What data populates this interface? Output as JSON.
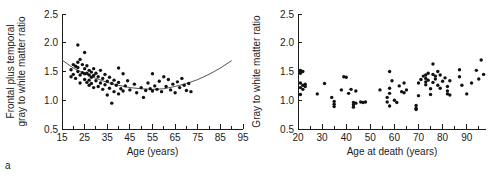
{
  "figure": {
    "panel_a_label": "a",
    "panel_b_label": "b"
  },
  "chart_data": [
    {
      "id": "panel-a",
      "type": "scatter",
      "title": "",
      "xlabel": "Age (years)",
      "ylabel": "Frontal plus temporal gray to white matter ratio",
      "ylabel_line1": "Frontal plus temporal",
      "ylabel_line2": "gray to white matter ratio",
      "xlim": [
        15,
        95
      ],
      "ylim": [
        0.5,
        2.5
      ],
      "xticks": [
        15,
        25,
        35,
        45,
        55,
        65,
        75,
        85,
        95
      ],
      "xtick_labels": [
        "15",
        "25",
        "35",
        "45",
        "55",
        "65",
        "75",
        "85",
        "95"
      ],
      "xminor_step": 5,
      "yticks": [
        0.5,
        1.0,
        1.5,
        2.0,
        2.5
      ],
      "ytick_labels": [
        "0.5",
        "1.0",
        "1.5",
        "2.0",
        "2.5"
      ],
      "grid": false,
      "legend": "none",
      "fit": {
        "type": "quadratic-curve",
        "description": "U-shaped fitted regression curve, minimum near age 50",
        "points": [
          [
            15,
            1.7
          ],
          [
            20,
            1.56
          ],
          [
            25,
            1.46
          ],
          [
            30,
            1.38
          ],
          [
            35,
            1.31
          ],
          [
            40,
            1.26
          ],
          [
            45,
            1.22
          ],
          [
            50,
            1.2
          ],
          [
            55,
            1.19
          ],
          [
            60,
            1.2
          ],
          [
            65,
            1.24
          ],
          [
            70,
            1.29
          ],
          [
            75,
            1.36
          ],
          [
            80,
            1.45
          ],
          [
            85,
            1.56
          ],
          [
            90,
            1.69
          ]
        ]
      },
      "points": [
        [
          19,
          1.53
        ],
        [
          19,
          1.41
        ],
        [
          20,
          1.62
        ],
        [
          20,
          1.45
        ],
        [
          21,
          1.59
        ],
        [
          21,
          1.38
        ],
        [
          22,
          1.96
        ],
        [
          22,
          1.66
        ],
        [
          22,
          1.57
        ],
        [
          22,
          1.5
        ],
        [
          23,
          1.71
        ],
        [
          23,
          1.44
        ],
        [
          23,
          1.3
        ],
        [
          24,
          1.62
        ],
        [
          24,
          1.48
        ],
        [
          25,
          1.83
        ],
        [
          25,
          1.55
        ],
        [
          25,
          1.46
        ],
        [
          25,
          1.36
        ],
        [
          26,
          1.6
        ],
        [
          26,
          1.47
        ],
        [
          26,
          1.31
        ],
        [
          27,
          1.52
        ],
        [
          27,
          1.44
        ],
        [
          27,
          1.35
        ],
        [
          27,
          1.26
        ],
        [
          28,
          1.49
        ],
        [
          28,
          1.4
        ],
        [
          28,
          1.29
        ],
        [
          29,
          1.55
        ],
        [
          29,
          1.43
        ],
        [
          29,
          1.22
        ],
        [
          30,
          1.47
        ],
        [
          30,
          1.34
        ],
        [
          31,
          1.41
        ],
        [
          31,
          1.24
        ],
        [
          32,
          1.52
        ],
        [
          32,
          1.3
        ],
        [
          33,
          1.38
        ],
        [
          33,
          1.19
        ],
        [
          34,
          1.45
        ],
        [
          34,
          1.27
        ],
        [
          35,
          1.33
        ],
        [
          35,
          1.09
        ],
        [
          36,
          1.4
        ],
        [
          36,
          1.21
        ],
        [
          37,
          1.29
        ],
        [
          37,
          0.95
        ],
        [
          38,
          1.35
        ],
        [
          38,
          1.15
        ],
        [
          39,
          1.26
        ],
        [
          40,
          1.56
        ],
        [
          40,
          1.31
        ],
        [
          40,
          1.11
        ],
        [
          41,
          1.2
        ],
        [
          42,
          1.46
        ],
        [
          42,
          1.16
        ],
        [
          43,
          1.25
        ],
        [
          44,
          1.34
        ],
        [
          45,
          1.18
        ],
        [
          47,
          1.28
        ],
        [
          48,
          1.13
        ],
        [
          50,
          1.22
        ],
        [
          51,
          1.05
        ],
        [
          52,
          1.17
        ],
        [
          53,
          1.3
        ],
        [
          54,
          1.2
        ],
        [
          55,
          1.46
        ],
        [
          55,
          1.16
        ],
        [
          56,
          1.25
        ],
        [
          57,
          1.19
        ],
        [
          58,
          1.33
        ],
        [
          59,
          1.15
        ],
        [
          60,
          1.41
        ],
        [
          61,
          1.24
        ],
        [
          62,
          1.36
        ],
        [
          63,
          1.18
        ],
        [
          64,
          1.28
        ],
        [
          65,
          1.13
        ],
        [
          66,
          1.32
        ],
        [
          67,
          1.22
        ],
        [
          68,
          1.38
        ],
        [
          69,
          1.26
        ],
        [
          70,
          1.17
        ],
        [
          71,
          1.29
        ],
        [
          72,
          1.15
        ]
      ]
    },
    {
      "id": "panel-b",
      "type": "scatter",
      "title": "",
      "xlabel": "Age at death (years)",
      "ylabel": "Gray to white matter ratio",
      "xlim": [
        20,
        98
      ],
      "ylim": [
        0.5,
        2.5
      ],
      "xticks": [
        20,
        30,
        40,
        50,
        60,
        70,
        80,
        90
      ],
      "xtick_labels": [
        "20",
        "30",
        "40",
        "50",
        "60",
        "70",
        "80",
        "90"
      ],
      "xminor_step": 5,
      "yticks": [
        0.5,
        1.0,
        1.5,
        2.0,
        2.5
      ],
      "ytick_labels": [
        "0.5",
        "1.0",
        "1.5",
        "2.0",
        "2.5"
      ],
      "grid": false,
      "legend": "none",
      "fit": null,
      "points": [
        [
          21,
          1.52
        ],
        [
          21,
          1.47
        ],
        [
          21,
          1.3
        ],
        [
          21,
          1.22
        ],
        [
          21,
          1.1
        ],
        [
          22,
          1.5
        ],
        [
          22,
          1.26
        ],
        [
          22,
          1.19
        ],
        [
          23,
          1.28
        ],
        [
          23,
          1.24
        ],
        [
          28,
          1.11
        ],
        [
          31,
          1.29
        ],
        [
          34,
          1.05
        ],
        [
          35,
          0.98
        ],
        [
          35,
          0.93
        ],
        [
          35,
          0.89
        ],
        [
          38,
          1.18
        ],
        [
          39,
          1.41
        ],
        [
          40,
          1.4
        ],
        [
          41,
          1.12
        ],
        [
          42,
          1.19
        ],
        [
          43,
          0.96
        ],
        [
          43,
          0.92
        ],
        [
          43,
          0.88
        ],
        [
          44,
          1.16
        ],
        [
          44,
          0.95
        ],
        [
          46,
          0.97
        ],
        [
          47,
          0.96
        ],
        [
          48,
          0.97
        ],
        [
          54,
          1.18
        ],
        [
          57,
          1.05
        ],
        [
          57,
          0.97
        ],
        [
          58,
          1.5
        ],
        [
          58,
          1.21
        ],
        [
          58,
          1.12
        ],
        [
          58,
          0.9
        ],
        [
          59,
          1.34
        ],
        [
          60,
          1.0
        ],
        [
          61,
          0.96
        ],
        [
          62,
          1.25
        ],
        [
          63,
          1.15
        ],
        [
          64,
          1.3
        ],
        [
          64,
          1.13
        ],
        [
          65,
          1.18
        ],
        [
          69,
          0.91
        ],
        [
          69,
          0.86
        ],
        [
          69,
          0.84
        ],
        [
          70,
          1.3
        ],
        [
          70,
          1.08
        ],
        [
          71,
          1.36
        ],
        [
          72,
          1.42
        ],
        [
          73,
          1.44
        ],
        [
          73,
          1.38
        ],
        [
          73,
          1.32
        ],
        [
          73,
          1.27
        ],
        [
          74,
          1.47
        ],
        [
          74,
          1.35
        ],
        [
          75,
          1.2
        ],
        [
          75,
          1.1
        ],
        [
          76,
          1.63
        ],
        [
          76,
          1.45
        ],
        [
          76,
          1.31
        ],
        [
          77,
          1.42
        ],
        [
          77,
          1.37
        ],
        [
          78,
          1.5
        ],
        [
          78,
          1.26
        ],
        [
          79,
          1.44
        ],
        [
          79,
          1.21
        ],
        [
          80,
          1.33
        ],
        [
          81,
          1.39
        ],
        [
          82,
          1.24
        ],
        [
          82,
          1.16
        ],
        [
          82,
          1.11
        ],
        [
          83,
          1.34
        ],
        [
          83,
          1.09
        ],
        [
          87,
          1.53
        ],
        [
          87,
          1.41
        ],
        [
          88,
          1.26
        ],
        [
          90,
          1.11
        ],
        [
          92,
          1.3
        ],
        [
          94,
          1.52
        ],
        [
          95,
          1.37
        ],
        [
          96,
          1.7
        ],
        [
          97,
          1.45
        ]
      ]
    }
  ]
}
